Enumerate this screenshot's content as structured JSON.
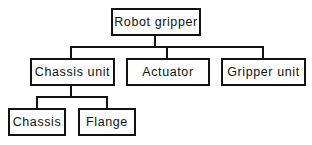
{
  "diagram": {
    "type": "tree",
    "root": {
      "label": "Robot gripper"
    },
    "level1": [
      {
        "label": "Chassis unit"
      },
      {
        "label": "Actuator"
      },
      {
        "label": "Gripper unit"
      }
    ],
    "level2": [
      {
        "label": "Chassis",
        "parent": "Chassis unit"
      },
      {
        "label": "Flange",
        "parent": "Chassis unit"
      }
    ]
  }
}
